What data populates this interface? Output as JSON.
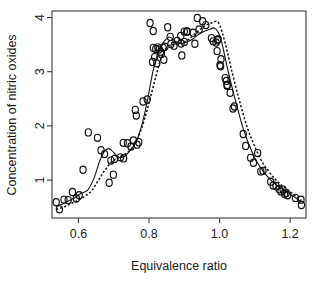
{
  "chart_data": {
    "type": "scatter",
    "title": "",
    "subtitle": "",
    "xlabel": "Equivalence ratio",
    "ylabel": "Concentration of nitric oxides",
    "xlim": [
      0.525,
      1.245
    ],
    "ylim": [
      0.3,
      4.12
    ],
    "xticks": [
      0.6,
      0.8,
      1.0,
      1.2
    ],
    "xtick_labels": [
      "0.6",
      "0.8",
      "1.0",
      "1.2"
    ],
    "yticks": [
      1,
      2,
      3,
      4
    ],
    "ytick_labels": [
      "1",
      "2",
      "3",
      "4"
    ],
    "grid": false,
    "legend": "none",
    "marker": "open-circle",
    "x": [
      0.907,
      0.761,
      1.108,
      1.016,
      1.189,
      1.001,
      1.231,
      1.123,
      1.042,
      1.215,
      0.93,
      1.152,
      0.727,
      1.184,
      0.812,
      0.835,
      0.86,
      0.822,
      0.9,
      0.795,
      0.99,
      1.022,
      0.766,
      1.18,
      0.816,
      0.771,
      0.812,
      0.833,
      0.996,
      0.81,
      0.994,
      0.825,
      0.893,
      1.232,
      1.193,
      1.169,
      1.174,
      1.16,
      1.145,
      1.117,
      1.088,
      1.096,
      1.074,
      1.038,
      1.067,
      1.03,
      1.021,
      1.019,
      1.004,
      1.003,
      0.993,
      0.982,
      0.977,
      0.961,
      0.952,
      0.937,
      0.942,
      0.925,
      0.909,
      0.9,
      0.891,
      0.89,
      0.88,
      0.871,
      0.862,
      0.853,
      0.845,
      0.842,
      0.84,
      0.828,
      0.819,
      0.803,
      0.783,
      0.764,
      0.756,
      0.749,
      0.739,
      0.728,
      0.719,
      0.702,
      0.699,
      0.692,
      0.687,
      0.674,
      0.664,
      0.654,
      0.628,
      0.613,
      0.602,
      0.594,
      0.583,
      0.571,
      0.559,
      0.546,
      0.537
    ],
    "y": [
      3.741,
      2.295,
      1.498,
      2.881,
      0.76,
      3.12,
      0.638,
      1.17,
      2.358,
      0.671,
      3.516,
      0.9,
      1.687,
      0.741,
      3.44,
      3.328,
      3.643,
      3.154,
      3.74,
      2.486,
      3.539,
      2.755,
      1.653,
      0.825,
      3.27,
      1.7,
      3.75,
      3.37,
      3.6,
      3.18,
      3.58,
      3.45,
      3.3,
      0.54,
      0.72,
      0.83,
      0.79,
      0.89,
      0.97,
      1.16,
      1.41,
      1.32,
      1.63,
      2.32,
      1.85,
      2.61,
      2.74,
      2.83,
      3.23,
      3.1,
      3.38,
      3.56,
      3.62,
      3.86,
      3.93,
      3.99,
      3.78,
      3.72,
      3.74,
      3.55,
      3.52,
      3.66,
      3.57,
      3.48,
      3.51,
      3.82,
      3.46,
      3.22,
      3.44,
      3.41,
      3.42,
      3.9,
      2.45,
      2.19,
      1.73,
      1.62,
      1.68,
      1.4,
      1.42,
      1.39,
      1.1,
      1.36,
      0.95,
      1.48,
      1.55,
      1.78,
      1.88,
      1.19,
      0.72,
      0.66,
      0.78,
      0.63,
      0.64,
      0.46,
      0.59
    ],
    "curves": [
      {
        "name": "solid-smoother",
        "style": "solid",
        "x": [
          0.537,
          0.555,
          0.573,
          0.591,
          0.609,
          0.627,
          0.645,
          0.659,
          0.673,
          0.687,
          0.701,
          0.715,
          0.731,
          0.747,
          0.763,
          0.779,
          0.795,
          0.811,
          0.827,
          0.843,
          0.859,
          0.875,
          0.891,
          0.907,
          0.923,
          0.939,
          0.955,
          0.971,
          0.987,
          1.003,
          1.019,
          1.035,
          1.051,
          1.067,
          1.083,
          1.099,
          1.115,
          1.131,
          1.147,
          1.163,
          1.179,
          1.195,
          1.211,
          1.232
        ],
        "y": [
          0.52,
          0.56,
          0.62,
          0.68,
          0.76,
          0.82,
          1.05,
          1.33,
          1.53,
          1.58,
          1.5,
          1.42,
          1.44,
          1.55,
          1.7,
          2.0,
          2.45,
          3.0,
          3.38,
          3.56,
          3.64,
          3.56,
          3.52,
          3.55,
          3.6,
          3.68,
          3.74,
          3.78,
          3.8,
          3.62,
          3.16,
          2.72,
          2.32,
          1.95,
          1.66,
          1.42,
          1.24,
          1.1,
          0.99,
          0.9,
          0.83,
          0.76,
          0.69,
          0.6
        ]
      },
      {
        "name": "dashed-smoother",
        "style": "dashed",
        "x": [
          0.537,
          0.557,
          0.577,
          0.597,
          0.617,
          0.637,
          0.657,
          0.677,
          0.697,
          0.717,
          0.737,
          0.757,
          0.777,
          0.797,
          0.817,
          0.837,
          0.857,
          0.877,
          0.897,
          0.917,
          0.937,
          0.957,
          0.977,
          0.997,
          1.017,
          1.037,
          1.057,
          1.077,
          1.097,
          1.117,
          1.137,
          1.157,
          1.177,
          1.197,
          1.217,
          1.232
        ],
        "y": [
          0.46,
          0.5,
          0.56,
          0.62,
          0.7,
          0.8,
          1.0,
          1.2,
          1.35,
          1.42,
          1.5,
          1.64,
          1.92,
          2.35,
          2.85,
          3.3,
          3.48,
          3.5,
          3.54,
          3.62,
          3.74,
          3.84,
          3.9,
          3.9,
          3.5,
          2.95,
          2.45,
          2.0,
          1.66,
          1.38,
          1.18,
          1.02,
          0.9,
          0.8,
          0.7,
          0.62
        ]
      }
    ]
  }
}
